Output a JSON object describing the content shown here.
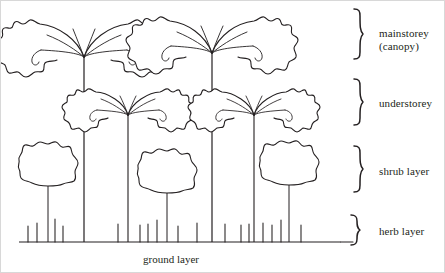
{
  "diagram": {
    "ground_label": "ground layer",
    "stroke_color": "#231f20",
    "background_color": "#ffffff",
    "layers": [
      {
        "id": "mainstorey",
        "label": "mainstorey\n(canopy)",
        "brace": "}"
      },
      {
        "id": "understorey",
        "label": "understorey",
        "brace": "}"
      },
      {
        "id": "shrub",
        "label": "shrub layer",
        "brace": "}"
      },
      {
        "id": "herb",
        "label": "herb layer",
        "brace": "}"
      }
    ],
    "vegetation": {
      "canopy_trees": 2,
      "understorey_trees": 2,
      "shrubs": 3,
      "herb_tufts": 17
    }
  }
}
